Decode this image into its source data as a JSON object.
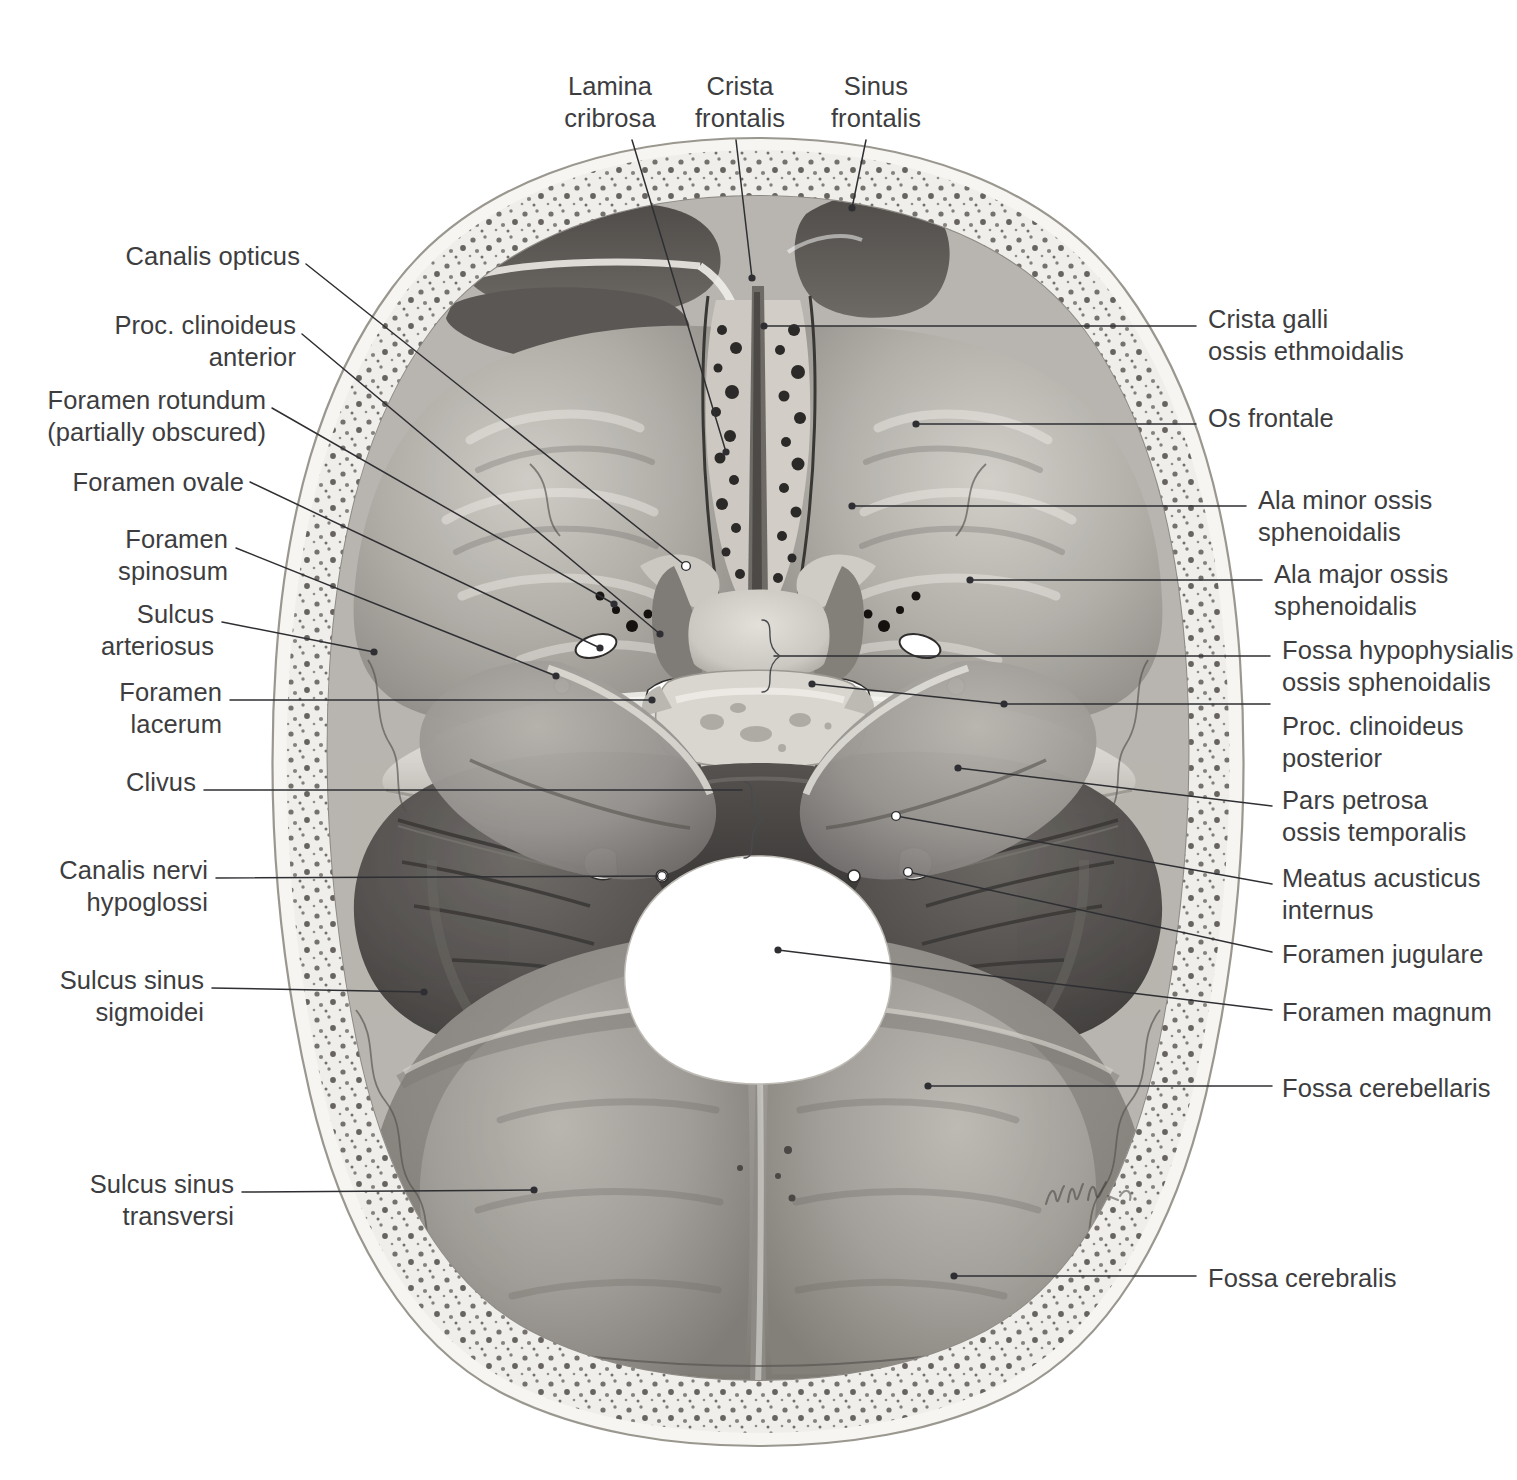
{
  "figure": {
    "view": "Internal surface of the cranial base, superior view",
    "artist_signature": "W. Wesker"
  },
  "labels": {
    "top": [
      {
        "id": "lamina-cribrosa",
        "text": "Lamina\ncribrosa"
      },
      {
        "id": "crista-frontalis",
        "text": "Crista\nfrontalis"
      },
      {
        "id": "sinus-frontalis",
        "text": "Sinus\nfrontalis"
      }
    ],
    "left": [
      {
        "id": "canalis-opticus",
        "text": "Canalis opticus"
      },
      {
        "id": "proc-clinoideus-anterior",
        "text": "Proc. clinoideus\nanterior"
      },
      {
        "id": "foramen-rotundum",
        "text": "Foramen rotundum\n(partially obscured)"
      },
      {
        "id": "foramen-ovale",
        "text": "Foramen ovale"
      },
      {
        "id": "foramen-spinosum",
        "text": "Foramen\nspinosum"
      },
      {
        "id": "sulcus-arteriosus",
        "text": "Sulcus\narteriosus"
      },
      {
        "id": "foramen-lacerum",
        "text": "Foramen\nlacerum"
      },
      {
        "id": "clivus",
        "text": "Clivus"
      },
      {
        "id": "canalis-nervi-hypoglossi",
        "text": "Canalis nervi\nhypoglossi"
      },
      {
        "id": "sulcus-sinus-sigmoidei",
        "text": "Sulcus sinus\nsigmoidei"
      },
      {
        "id": "sulcus-sinus-transversi",
        "text": "Sulcus sinus\ntransversi"
      }
    ],
    "right": [
      {
        "id": "crista-galli",
        "text": "Crista galli\nossis ethmoidalis"
      },
      {
        "id": "os-frontale",
        "text": "Os frontale"
      },
      {
        "id": "ala-minor",
        "text": "Ala minor ossis\nsphenoidalis"
      },
      {
        "id": "ala-major",
        "text": "Ala major ossis\nsphenoidalis"
      },
      {
        "id": "fossa-hypophysialis",
        "text": "Fossa hypophysialis\nossis sphenoidalis"
      },
      {
        "id": "proc-clinoideus-posterior",
        "text": "Proc. clinoideus\nposterior"
      },
      {
        "id": "pars-petrosa",
        "text": "Pars petrosa\nossis temporalis"
      },
      {
        "id": "meatus-acusticus-internus",
        "text": "Meatus acusticus\ninternus"
      },
      {
        "id": "foramen-jugulare",
        "text": "Foramen jugulare"
      },
      {
        "id": "foramen-magnum",
        "text": "Foramen magnum"
      },
      {
        "id": "fossa-cerebellaris",
        "text": "Fossa cerebellaris"
      },
      {
        "id": "fossa-cerebralis",
        "text": "Fossa cerebralis"
      }
    ]
  },
  "colors": {
    "text": "#3d3d40",
    "leader": "#2f2f33",
    "background": "#ffffff",
    "bone_outer": "#f2f1ee",
    "bone_light": "#d9d7d2",
    "bone_mid": "#b6b3ad",
    "bone_dark": "#8b8782",
    "cavity_dark": "#5d5a57",
    "cavity_darkest": "#3e3c3a",
    "foramen_white": "#ffffff"
  }
}
